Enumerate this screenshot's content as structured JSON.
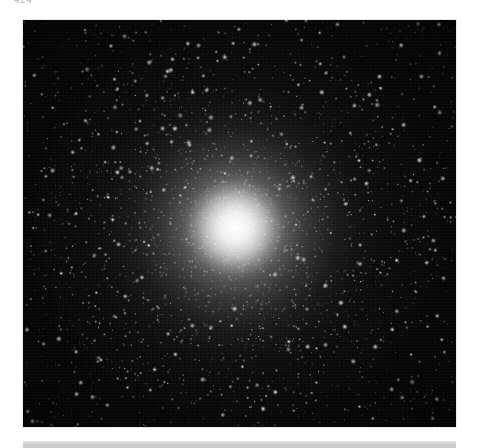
{
  "page": {
    "width": 477,
    "height": 448,
    "background_color": "#ffffff",
    "page_label": "424"
  },
  "plate": {
    "caption": "",
    "subject": "globular star cluster",
    "background_color": "#070707",
    "core_color": "#ffffff",
    "geometry": {
      "left": 23,
      "top": 20,
      "width": 433,
      "height": 407
    },
    "core": {
      "center_x_pct": 49,
      "center_y_pct": 51,
      "bright_core_radius_px": 54,
      "inner_halo_radius_px": 128,
      "outer_halo_radius_px": 215
    }
  },
  "footer_band": {
    "color": "#cfcfcf",
    "left": 23,
    "top": 441,
    "width": 433,
    "height": 7
  }
}
